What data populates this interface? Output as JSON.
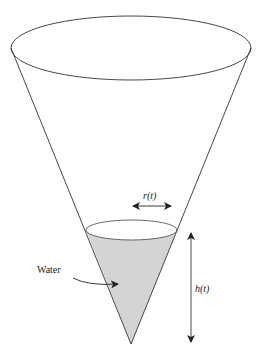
{
  "diagram": {
    "labels": {
      "radius": "r(t)",
      "height": "h(t)",
      "water": "Water"
    },
    "colors": {
      "stroke": "#333333",
      "water_fill": "#d4d4d4",
      "background": "#ffffff"
    }
  }
}
